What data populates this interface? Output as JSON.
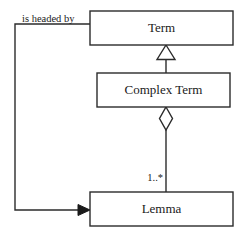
{
  "diagram": {
    "type": "uml-class-diagram",
    "title": "",
    "background_color": "#ffffff",
    "line_color": "#2b2b2b",
    "text_color": "#1a1a1a",
    "classes": [
      {
        "id": "term",
        "name": "Term",
        "x": 90,
        "y": 11,
        "width": 143,
        "height": 34
      },
      {
        "id": "complex_term",
        "name": "Complex Term",
        "x": 97,
        "y": 73,
        "width": 133,
        "height": 34
      },
      {
        "id": "lemma",
        "name": "Lemma",
        "x": 90,
        "y": 192,
        "width": 143,
        "height": 34
      }
    ],
    "relationships": [
      {
        "id": "generalization",
        "kind": "generalization",
        "from": "complex_term",
        "to": "term",
        "marker": "hollow-triangle",
        "label": "",
        "multiplicity": ""
      },
      {
        "id": "aggregation",
        "kind": "aggregation",
        "from": "complex_term",
        "to": "lemma",
        "marker": "hollow-diamond",
        "label": "",
        "multiplicity": "1..*"
      },
      {
        "id": "is-headed-by",
        "kind": "association",
        "from": "term",
        "to": "lemma",
        "marker": "solid-arrow",
        "label": "is headed by",
        "multiplicity": ""
      }
    ]
  }
}
